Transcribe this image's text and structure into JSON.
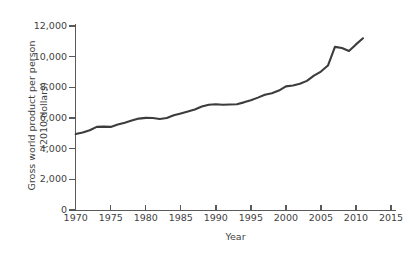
{
  "chart_data": {
    "type": "line",
    "title": "",
    "xlabel": "Year",
    "ylabel": "Gross world product per person\n(2010 dollars)",
    "xlim": [
      1970,
      2015
    ],
    "ylim": [
      0,
      12000
    ],
    "grid": false,
    "legend": null,
    "line_color": "#3c3c3c",
    "axis_color": "#5a5a5a",
    "xticks": [
      1970,
      1975,
      1980,
      1985,
      1990,
      1995,
      2000,
      2005,
      2010,
      2015
    ],
    "xtick_labels": [
      "1970",
      "1975",
      "1980",
      "1985",
      "1990",
      "1995",
      "2000",
      "2005",
      "2010",
      "2015"
    ],
    "yticks": [
      0,
      2000,
      4000,
      6000,
      8000,
      10000,
      12000
    ],
    "ytick_labels": [
      "0",
      "2,000",
      "4,000",
      "6,000",
      "8,000",
      "10,000",
      "12,000"
    ],
    "x": [
      1970,
      1971,
      1972,
      1973,
      1974,
      1975,
      1976,
      1977,
      1978,
      1979,
      1980,
      1981,
      1982,
      1983,
      1984,
      1985,
      1986,
      1987,
      1988,
      1989,
      1990,
      1991,
      1992,
      1993,
      1994,
      1995,
      1996,
      1997,
      1998,
      1999,
      2000,
      2001,
      2002,
      2003,
      2004,
      2005,
      2006,
      2007,
      2008,
      2009,
      2010,
      2011
    ],
    "values": [
      4960,
      5060,
      5200,
      5420,
      5440,
      5420,
      5570,
      5690,
      5830,
      5960,
      6010,
      6000,
      5940,
      6000,
      6180,
      6300,
      6420,
      6560,
      6750,
      6860,
      6900,
      6860,
      6880,
      6900,
      7020,
      7160,
      7330,
      7520,
      7620,
      7790,
      8060,
      8120,
      8230,
      8420,
      8760,
      9030,
      9420,
      10640,
      10560,
      10370,
      10800,
      11200
    ]
  }
}
